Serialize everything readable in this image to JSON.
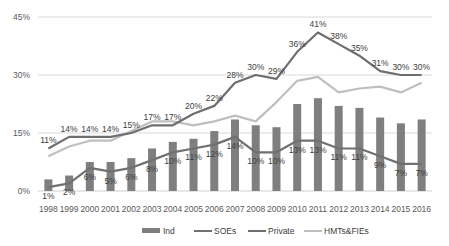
{
  "chart_data": {
    "type": "bar+line",
    "title": "",
    "xlabel": "",
    "ylabel": "",
    "ylim": [
      0,
      45
    ],
    "yticks": [
      "0%",
      "15%",
      "30%",
      "45%"
    ],
    "grid": true,
    "legend_position": "bottom",
    "categories": [
      "1998",
      "1999",
      "2000",
      "2001",
      "2002",
      "2003",
      "2004",
      "2005",
      "2006",
      "2007",
      "2008",
      "2009",
      "2010",
      "2011",
      "2012",
      "2013",
      "2014",
      "2015",
      "2016"
    ],
    "series": [
      {
        "name": "Ind",
        "type": "bar",
        "color": "#7f7f7f",
        "values": [
          3,
          4,
          7.5,
          7.5,
          8.5,
          11,
          12.7,
          13.5,
          15.5,
          18.5,
          17,
          16.5,
          22.5,
          24,
          22,
          21.5,
          19,
          17.5,
          18.5
        ]
      },
      {
        "name": "SOEs",
        "type": "line",
        "color": "#707070",
        "values": [
          1,
          2,
          6,
          5,
          6,
          8,
          10,
          11,
          12,
          14,
          10,
          10,
          13,
          13,
          11,
          11,
          9,
          7,
          7
        ],
        "labels": [
          "1%",
          "2%",
          "6%",
          "5%",
          "6%",
          "8%",
          "10%",
          "11%",
          "12%",
          "14%",
          "10%",
          "10%",
          "13%",
          "13%",
          "11%",
          "11%",
          "9%",
          "7%",
          "7%"
        ]
      },
      {
        "name": "Private",
        "type": "line",
        "color": "#6e6e6e",
        "values": [
          11,
          14,
          14,
          14,
          15,
          17,
          17,
          20,
          22,
          28,
          30,
          29,
          36,
          41,
          38,
          35,
          31,
          30,
          30
        ],
        "labels": [
          "11%",
          "14%",
          "14%",
          "14%",
          "15%",
          "17%",
          "17%",
          "20%",
          "22%",
          "28%",
          "30%",
          "29%",
          "36%",
          "41%",
          "38%",
          "35%",
          "31%",
          "30%",
          "30%"
        ]
      },
      {
        "name": "HMTs&FIEs",
        "type": "line",
        "color": "#bfbfbf",
        "values": [
          9,
          11.5,
          13,
          13,
          15.5,
          18,
          18,
          17,
          18,
          19.5,
          18,
          23,
          28.5,
          29.5,
          25.5,
          26.5,
          27,
          25.5,
          28
        ]
      }
    ]
  },
  "legend": {
    "ind": "Ind",
    "soes": "SOEs",
    "private": "Private",
    "hmts": "HMTs&FIEs"
  }
}
